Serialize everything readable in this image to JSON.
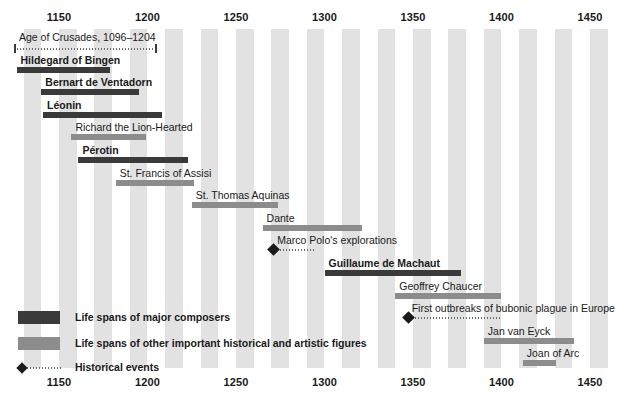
{
  "chart_data": {
    "type": "timeline",
    "title": "",
    "xlabel": "",
    "xlim": [
      1126,
      1470
    ],
    "grid": "banded-decades",
    "axis_ticks": [
      {
        "label": "1150",
        "value": 1150
      },
      {
        "label": "1200",
        "value": 1200
      },
      {
        "label": "1250",
        "value": 1250
      },
      {
        "label": "1300",
        "value": 1300
      },
      {
        "label": "1350",
        "value": 1350
      },
      {
        "label": "1400",
        "value": 1400
      },
      {
        "label": "1450",
        "value": 1450
      }
    ],
    "axis_position": "top-and-bottom",
    "bands": {
      "color": "#e2e2e2",
      "interval_years": 10
    },
    "colors": {
      "composer": "#3a3a3a",
      "figure": "#8c8c8c",
      "event": "#1a1a1a",
      "band": "#e2e2e2",
      "text": "#1a1a1a",
      "background": "#ffffff"
    },
    "rows": [
      {
        "label": "Age of Crusades, 1096–1204",
        "kind": "event-span",
        "start": 1126,
        "end": 1204,
        "bold": false
      },
      {
        "label": "Hildegard of Bingen",
        "kind": "composer",
        "start": 1126,
        "end": 1179,
        "bold": true
      },
      {
        "label": "Bernart de Ventadorn",
        "kind": "composer",
        "start": 1140,
        "end": 1195,
        "bold": true
      },
      {
        "label": "Léonin",
        "kind": "composer",
        "start": 1141,
        "end": 1208,
        "bold": true
      },
      {
        "label": "Richard the Lion-Hearted",
        "kind": "figure",
        "start": 1157,
        "end": 1199,
        "bold": false
      },
      {
        "label": "Pérotin",
        "kind": "composer",
        "start": 1161,
        "end": 1223,
        "bold": true
      },
      {
        "label": "St. Francis of Assisi",
        "kind": "figure",
        "start": 1182,
        "end": 1226,
        "bold": false
      },
      {
        "label": "St. Thomas Aquinas",
        "kind": "figure",
        "start": 1225,
        "end": 1274,
        "bold": false
      },
      {
        "label": "Dante",
        "kind": "figure",
        "start": 1265,
        "end": 1321,
        "bold": false
      },
      {
        "label": "Marco Polo's explorations",
        "kind": "event",
        "start": 1271,
        "end": 1295,
        "bold": false
      },
      {
        "label": "Guillaume de Machaut",
        "kind": "composer",
        "start": 1300,
        "end": 1377,
        "bold": true
      },
      {
        "label": "Geoffrey Chaucer",
        "kind": "figure",
        "start": 1340,
        "end": 1400,
        "bold": false
      },
      {
        "label": "First outbreaks of bubonic plague in Europe",
        "kind": "event",
        "start": 1347,
        "end": 1400,
        "bold": false
      },
      {
        "label": "Jan van Eyck",
        "kind": "figure",
        "start": 1390,
        "end": 1441,
        "bold": false
      },
      {
        "label": "Joan of Arc",
        "kind": "figure",
        "start": 1412,
        "end": 1431,
        "bold": false
      }
    ],
    "legend": {
      "position": "bottom-left",
      "entries": [
        {
          "swatch": "composer",
          "label": "Life spans of major composers"
        },
        {
          "swatch": "figure",
          "label": "Life spans of other important historical and artistic figures"
        },
        {
          "swatch": "event",
          "label": "Historical events"
        }
      ]
    }
  }
}
